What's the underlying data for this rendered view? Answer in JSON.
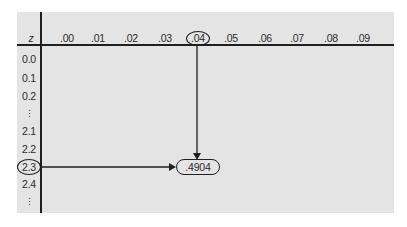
{
  "table": {
    "corner_label": "z",
    "column_headers": [
      ".00",
      ".01",
      ".02",
      ".03",
      ".04",
      ".05",
      ".06",
      ".07",
      ".08",
      ".09"
    ],
    "row_labels": [
      "0.0",
      "0.1",
      "0.2",
      "⋮",
      "2.1",
      "2.2",
      "2.3",
      "2.4",
      "⋮"
    ],
    "highlighted_column": ".04",
    "highlighted_row": "2.3",
    "result_value": ".4904"
  },
  "colors": {
    "panel_background": "#e4e4e4",
    "line_color": "#1f1f1f",
    "text_color": "#2a2a2a"
  }
}
